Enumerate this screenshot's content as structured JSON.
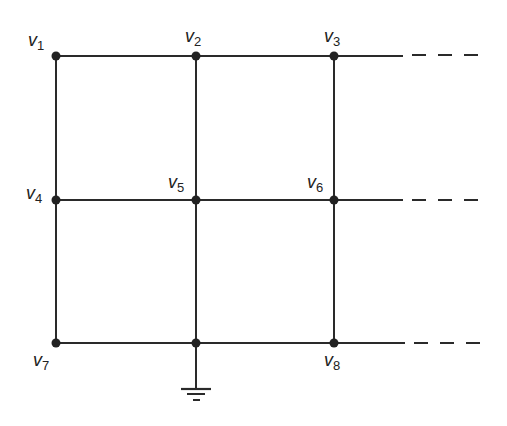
{
  "diagram": {
    "type": "resistive-grid-network",
    "line_color": "#2a2a2a",
    "nodes": [
      {
        "id": "v1",
        "label": "v",
        "sub": "1",
        "x": 56,
        "y": 56,
        "lx": 28,
        "ly": 30
      },
      {
        "id": "v2",
        "label": "v",
        "sub": "2",
        "x": 196,
        "y": 56,
        "lx": 185,
        "ly": 26
      },
      {
        "id": "v3",
        "label": "v",
        "sub": "3",
        "x": 334,
        "y": 56,
        "lx": 324,
        "ly": 26
      },
      {
        "id": "v4",
        "label": "v",
        "sub": "4",
        "x": 56,
        "y": 200,
        "lx": 26,
        "ly": 183
      },
      {
        "id": "v5",
        "label": "v",
        "sub": "5",
        "x": 196,
        "y": 200,
        "lx": 168,
        "ly": 172
      },
      {
        "id": "v6",
        "label": "v",
        "sub": "6",
        "x": 334,
        "y": 200,
        "lx": 307,
        "ly": 172
      },
      {
        "id": "v7",
        "label": "v",
        "sub": "7",
        "x": 56,
        "y": 343,
        "lx": 33,
        "ly": 350
      },
      {
        "id": "",
        "label": "",
        "sub": "",
        "x": 196,
        "y": 343
      },
      {
        "id": "v8",
        "label": "v",
        "sub": "8",
        "x": 334,
        "y": 343,
        "lx": 324,
        "ly": 350
      }
    ],
    "ground_node": "bottom-middle",
    "continuation": "dashed lines extend rows to the right"
  }
}
